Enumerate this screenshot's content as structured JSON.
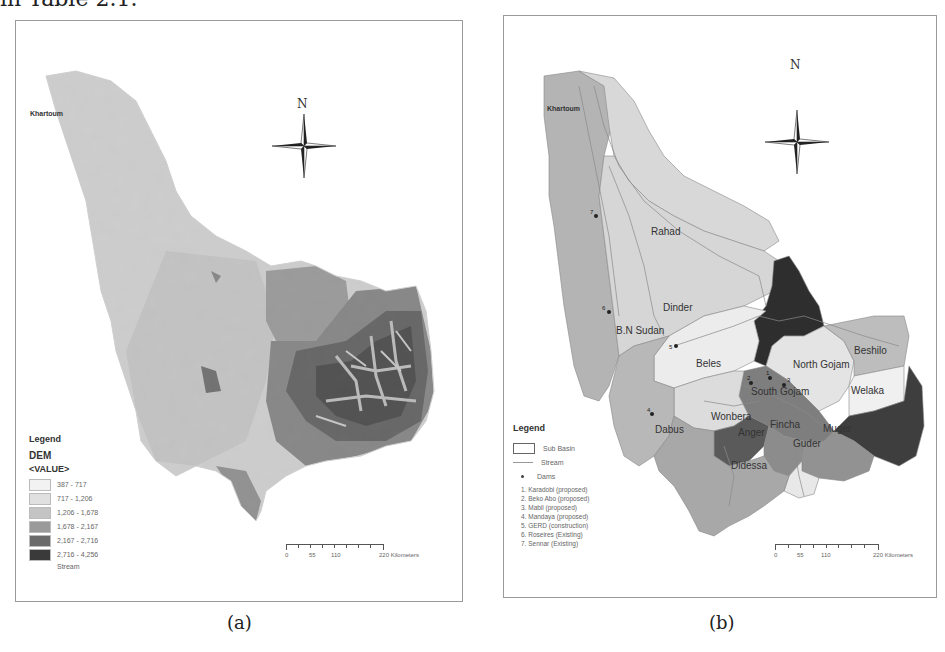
{
  "page": {
    "top_text": "in Table 2.1."
  },
  "panel_a": {
    "caption": "(a)",
    "north_label": "N",
    "city_label": "Khartoum",
    "legend": {
      "title": "Legend",
      "layer": "DEM",
      "field": "<VALUE>",
      "classes": [
        {
          "label": "387 - 717",
          "color": "#f2f2f2"
        },
        {
          "label": "717 - 1,206",
          "color": "#e0e0e0"
        },
        {
          "label": "1,206 - 1,678",
          "color": "#c4c4c4"
        },
        {
          "label": "1,678 - 2,167",
          "color": "#9a9a9a"
        },
        {
          "label": "2,167 - 2,716",
          "color": "#6a6a6a"
        },
        {
          "label": "2,716 - 4,256",
          "color": "#3a3a3a"
        }
      ],
      "stream_label": "Stream"
    },
    "scale_bar": {
      "ticks": [
        "0",
        "55",
        "110",
        "220 Kilometers"
      ]
    }
  },
  "panel_b": {
    "caption": "(b)",
    "north_label": "N",
    "city_label": "Khartoum",
    "sub_basins": [
      {
        "name": "Rahad",
        "color": "#d8d8d8"
      },
      {
        "name": "Dinder",
        "color": "#d6d6d6"
      },
      {
        "name": "B.N Sudan",
        "color": "#b4b4b4"
      },
      {
        "name": "Tana",
        "color": "#2e2e2e"
      },
      {
        "name": "Beshilo",
        "color": "#bdbdbd"
      },
      {
        "name": "Beles",
        "color": "#ececec"
      },
      {
        "name": "North Gojam",
        "color": "#e4e4e4"
      },
      {
        "name": "Welaka",
        "color": "#f0f0f0"
      },
      {
        "name": "South Gojam",
        "color": "#7e7e7e"
      },
      {
        "name": "Wonbera",
        "color": "#dcdcdc"
      },
      {
        "name": "Jemma",
        "color": "#3e3e3e"
      },
      {
        "name": "Dabus",
        "color": "#b8b8b8"
      },
      {
        "name": "Anger",
        "color": "#5a5a5a"
      },
      {
        "name": "Fincha",
        "color": "#8c8c8c"
      },
      {
        "name": "Muger",
        "color": "#929292"
      },
      {
        "name": "Guder",
        "color": "#e8e8e8"
      },
      {
        "name": "Didessa",
        "color": "#a8a8a8"
      }
    ],
    "dam_markers": [
      "1",
      "2",
      "3",
      "4",
      "5",
      "6",
      "7"
    ],
    "legend": {
      "title": "Legend",
      "sub_basin_label": "Sub Basin",
      "stream_label": "Stream",
      "dams_label": "Dams",
      "dams": [
        "1. Karadobi (proposed)",
        "2. Beko Abo (proposed)",
        "3. Mabil (proposed)",
        "4. Mandaya (proposed)",
        "5. GERD (construction)",
        "6. Roseires (Existing)",
        "7. Sennar (Existing)"
      ]
    },
    "scale_bar": {
      "ticks": [
        "0",
        "55",
        "110",
        "220 Kilometers"
      ]
    }
  }
}
